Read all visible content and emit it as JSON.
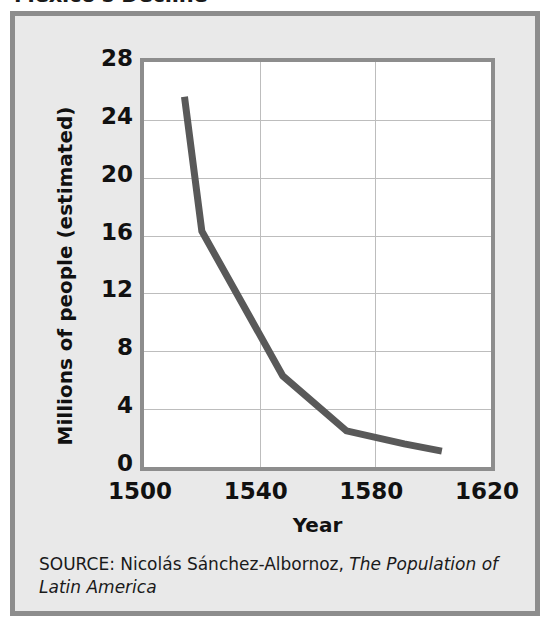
{
  "figure": {
    "title": "Mexico's Decline",
    "source_prefix": "SOURCE: Nicolás Sánchez-Albornoz, ",
    "source_title": "The Population of Latin America",
    "colors": {
      "panel_background": "#e9e9e9",
      "panel_border": "#8d8d8d",
      "plot_background": "#ffffff",
      "plot_border": "#8d8d8d",
      "gridline": "#bdbdbd",
      "series_line": "#595959",
      "text": "#111111"
    }
  },
  "chart_data": {
    "type": "line",
    "title": "Mexico's Decline",
    "xlabel": "Year",
    "ylabel": "Millions of people (estimated)",
    "xlim": [
      1500,
      1620
    ],
    "ylim": [
      0,
      28
    ],
    "xticks": [
      1500,
      1540,
      1580,
      1620
    ],
    "yticks": [
      0,
      4,
      8,
      12,
      16,
      20,
      24,
      28
    ],
    "xtick_labels": [
      "1500",
      "1540",
      "1580",
      "1620"
    ],
    "ytick_labels": [
      "0",
      "4",
      "8",
      "12",
      "16",
      "20",
      "24",
      "28"
    ],
    "grid": true,
    "legend": false,
    "series": [
      {
        "name": "Population of Mexico (estimated)",
        "x": [
          1514,
          1520,
          1548,
          1570,
          1590,
          1603
        ],
        "y": [
          25.6,
          16.3,
          6.3,
          2.5,
          1.6,
          1.1
        ]
      }
    ]
  }
}
